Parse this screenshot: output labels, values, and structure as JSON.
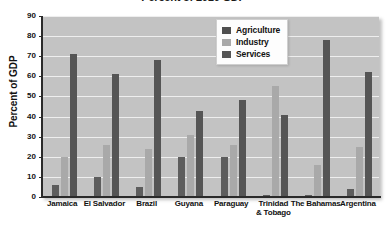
{
  "chart_data": {
    "type": "bar",
    "title": "Percent of 2010 GDP",
    "xlabel": "",
    "ylabel": "Percent of GDP",
    "ylim": [
      0,
      90
    ],
    "yticks": [
      0,
      10,
      20,
      30,
      40,
      50,
      60,
      70,
      80,
      90
    ],
    "grid": true,
    "legend_position": "top-right",
    "categories": [
      "Jamaica",
      "El Salvador",
      "Brazil",
      "Guyana",
      "Paraguay",
      "Trinidad\n& Tobago",
      "The Bahamas",
      "Argentina"
    ],
    "series": [
      {
        "name": "Agriculture",
        "color": "#5d5d5d",
        "values": [
          6,
          10,
          5,
          20,
          20,
          1,
          1,
          4
        ]
      },
      {
        "name": "Industry",
        "color": "#a9a9a9",
        "values": [
          20,
          26,
          24,
          31,
          26,
          55,
          16,
          25
        ]
      },
      {
        "name": "Services",
        "color": "#555555",
        "values": [
          71,
          61,
          68,
          43,
          48,
          41,
          78,
          62
        ]
      }
    ]
  },
  "colors": {
    "plot_background": "#c3c3c3",
    "gridline": "#eeeeee",
    "axis": "#2a2a2a",
    "page_background": "#ffffff"
  }
}
